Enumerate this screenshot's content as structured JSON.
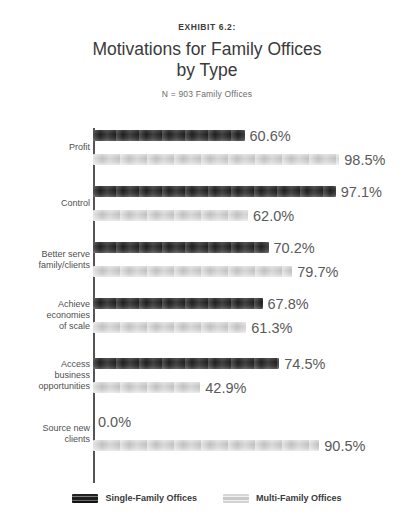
{
  "header": {
    "exhibit": "EXHIBIT 6.2:",
    "title_line1": "Motivations for Family Offices",
    "title_line2": "by Type",
    "subtitle": "N = 903 Family Offices"
  },
  "legend": {
    "items": [
      {
        "label": "Single-Family Offices",
        "color": "#1e1e1e",
        "key": "single"
      },
      {
        "label": "Multi-Family Offices",
        "color": "#c8c8c8",
        "key": "multi"
      }
    ]
  },
  "chart_data": {
    "type": "bar",
    "orientation": "horizontal",
    "title": "Motivations for Family Offices by Type",
    "subtitle": "N = 903 Family Offices",
    "xlabel": "",
    "ylabel": "",
    "xlim": [
      0,
      100
    ],
    "grid": false,
    "legend_position": "bottom",
    "value_suffix": "%",
    "categories": [
      "Profit",
      "Control",
      "Better serve family/clients",
      "Achieve economies of scale",
      "Access business opportunities",
      "Source new clients"
    ],
    "category_lines": [
      [
        "Profit"
      ],
      [
        "Control"
      ],
      [
        "Better serve",
        "family/clients"
      ],
      [
        "Achieve",
        "economies",
        "of scale"
      ],
      [
        "Access",
        "business",
        "opportunities"
      ],
      [
        "Source new",
        "clients"
      ]
    ],
    "series": [
      {
        "name": "Single-Family Offices",
        "color": "#1e1e1e",
        "values": [
          60.6,
          97.1,
          70.2,
          67.8,
          74.5,
          0.0
        ],
        "labels": [
          "60.6%",
          "97.1%",
          "70.2%",
          "67.8%",
          "74.5%",
          "0.0%"
        ]
      },
      {
        "name": "Multi-Family Offices",
        "color": "#c8c8c8",
        "values": [
          98.5,
          62.0,
          79.7,
          61.3,
          42.9,
          90.5
        ],
        "labels": [
          "98.5%",
          "62.0%",
          "79.7%",
          "61.3%",
          "42.9%",
          "90.5%"
        ]
      }
    ]
  }
}
